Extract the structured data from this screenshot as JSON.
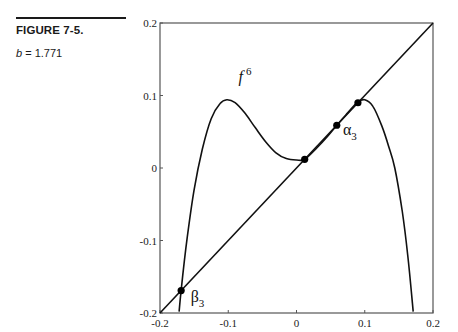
{
  "caption": {
    "title": "FIGURE 7-5.",
    "param_name": "b",
    "param_eq": " = 1.771"
  },
  "chart_data": {
    "type": "line",
    "title": "",
    "xlabel": "",
    "ylabel": "",
    "xlim": [
      -0.2,
      0.2
    ],
    "ylim": [
      -0.2,
      0.2
    ],
    "grid": false,
    "x_ticks": [
      "-0.2",
      "-0.1",
      "0",
      "0.1",
      "0.2"
    ],
    "y_ticks": [
      "0.2",
      "0.1",
      "0",
      "-0.1",
      "-0.2"
    ],
    "series": [
      {
        "name": "f^6",
        "x": [
          -0.172,
          -0.169,
          -0.16,
          -0.15,
          -0.138,
          -0.125,
          -0.112,
          -0.102,
          -0.09,
          -0.075,
          -0.06,
          -0.045,
          -0.03,
          -0.015,
          0.0,
          0.012,
          0.03,
          0.045,
          0.059,
          0.075,
          0.09,
          0.1,
          0.112,
          0.125,
          0.135,
          0.144,
          0.155,
          0.163,
          0.171
        ],
        "y": [
          -0.198,
          -0.168,
          -0.095,
          -0.03,
          0.026,
          0.068,
          0.089,
          0.094,
          0.09,
          0.075,
          0.055,
          0.036,
          0.021,
          0.013,
          0.011,
          0.012,
          0.028,
          0.043,
          0.059,
          0.076,
          0.091,
          0.094,
          0.085,
          0.058,
          0.03,
          0.0,
          -0.06,
          -0.12,
          -0.198
        ]
      },
      {
        "name": "diagonal y = x",
        "x": [
          -0.2,
          0.2
        ],
        "y": [
          -0.2,
          0.2
        ]
      }
    ],
    "points": [
      {
        "label": "β3",
        "x": -0.169,
        "y": -0.169
      },
      {
        "label": "",
        "x": 0.012,
        "y": 0.012
      },
      {
        "label": "α3",
        "x": 0.059,
        "y": 0.059
      },
      {
        "label": "",
        "x": 0.09,
        "y": 0.09
      }
    ],
    "annotations": [
      {
        "text": "f",
        "superscript": "6",
        "x": -0.085,
        "y": 0.118
      },
      {
        "text": "α",
        "subscript": "3",
        "x": 0.068,
        "y": 0.045
      },
      {
        "text": "β",
        "subscript": "3",
        "x": -0.155,
        "y": -0.185
      }
    ]
  }
}
